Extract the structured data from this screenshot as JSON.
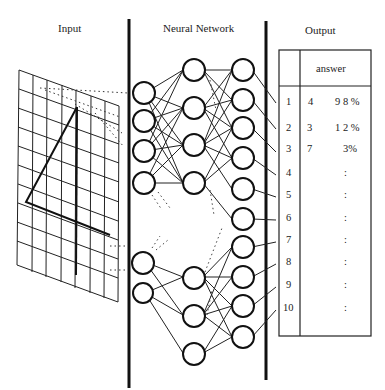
{
  "sections": {
    "input": "Input",
    "network": "Neural  Network",
    "output": "Output"
  },
  "output_table": {
    "header": "answer",
    "rows": [
      {
        "index": "1",
        "answer": "4",
        "confidence": "9 8 %"
      },
      {
        "index": "2",
        "answer": "3",
        "confidence": "1 2 %"
      },
      {
        "index": "3",
        "answer": "7",
        "confidence": "3%"
      },
      {
        "index": "4",
        "answer": "",
        "confidence": ":"
      },
      {
        "index": "5",
        "answer": "",
        "confidence": ":"
      },
      {
        "index": "6",
        "answer": "",
        "confidence": ":"
      },
      {
        "index": "7",
        "answer": "",
        "confidence": ":"
      },
      {
        "index": "8",
        "answer": "",
        "confidence": ":"
      },
      {
        "index": "9",
        "answer": "",
        "confidence": ":"
      },
      {
        "index": "10",
        "answer": "",
        "confidence": ":"
      }
    ]
  },
  "colors": {
    "line": "#222222",
    "background": "#ffffff"
  }
}
